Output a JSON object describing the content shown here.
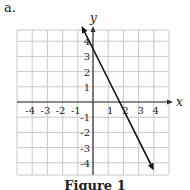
{
  "label": "a.",
  "caption": "Figure 1",
  "chart_data": {
    "type": "line",
    "title": "Figure 1",
    "xlabel": "x",
    "ylabel": "y",
    "xlim": [
      -5,
      5
    ],
    "ylim": [
      -5,
      5
    ],
    "grid": true,
    "x_ticks": [
      -4,
      -3,
      -2,
      -1,
      1,
      2,
      3,
      4
    ],
    "y_ticks": [
      4,
      3,
      2,
      1,
      -1,
      -2,
      -3,
      -4
    ],
    "series": [
      {
        "name": "line",
        "equation": "y = -2x + 3.5",
        "x": [
          -0.75,
          4
        ],
        "y": [
          5,
          -4.5
        ]
      }
    ]
  }
}
